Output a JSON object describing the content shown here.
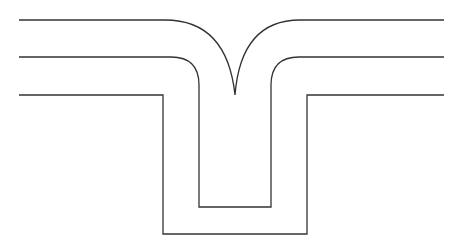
{
  "diagram": {
    "stroke_color": "#333333",
    "background": "#ffffff",
    "stroke_width": 1.3,
    "lines": [
      {
        "name": "top-line",
        "left_segment": {
          "x_start": 19,
          "x_end": 165,
          "y": 20
        },
        "left_arc_to_cusp": {
          "from": [
            165,
            20
          ],
          "to": [
            235,
            95
          ]
        },
        "right_arc_from_cusp": {
          "from": [
            235,
            95
          ],
          "to": [
            300,
            20
          ]
        },
        "right_segment": {
          "x_start": 300,
          "x_end": 444,
          "y": 20
        }
      },
      {
        "name": "middle-line",
        "y": 57,
        "left_x_start": 19,
        "inner_left_x": 199,
        "inner_right_x": 271,
        "inner_bottom_y": 207,
        "right_x_end": 444,
        "corner_radius": 28
      },
      {
        "name": "bottom-line",
        "y": 95,
        "left_x_start": 19,
        "outer_left_x": 163,
        "outer_right_x": 307,
        "outer_bottom_y": 234,
        "right_x_end": 444
      }
    ]
  }
}
